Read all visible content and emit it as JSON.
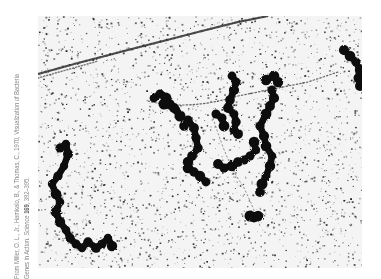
{
  "caption": {
    "line1": "From Miller, O. L., Jr., Hamkalo, B., & Thomas, C., 1970, Visualization of Bacteria",
    "line2_prefix": "Genes in Action. ",
    "line2_journal": "Science ",
    "line2_volume": "169",
    "line2_pages": ", 392–395."
  },
  "figure": {
    "background_color": "#f4f4f4",
    "speck_color": "#1a1a1a",
    "chain_color": "#0a0a0a"
  }
}
